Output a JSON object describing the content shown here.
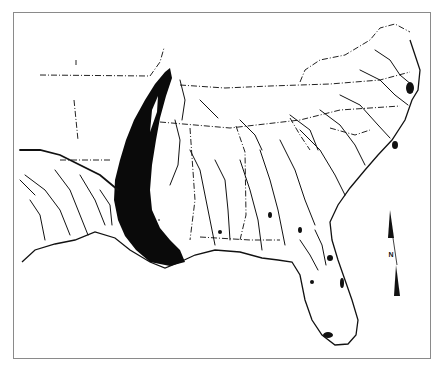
{
  "map": {
    "subject": "Southeastern United States drainage map with shaded Mississippi Alluvial Valley band",
    "north_arrow": {
      "label": "N"
    },
    "colors": {
      "ink": "#111111",
      "band_fill": "#0a0a0a",
      "frame": "#8a8a8a",
      "background": "#ffffff"
    }
  }
}
